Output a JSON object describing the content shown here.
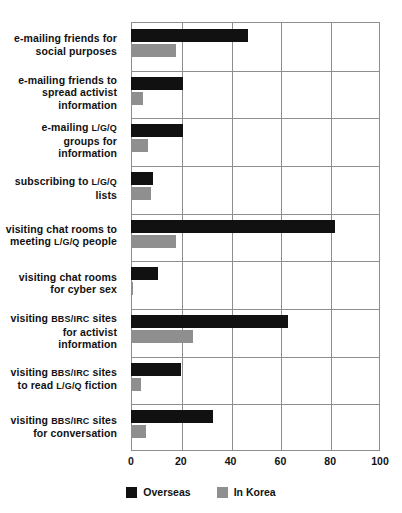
{
  "chart_data": {
    "type": "bar",
    "orientation": "horizontal",
    "title": "",
    "xlabel": "",
    "ylabel": "",
    "xlim": [
      0,
      100
    ],
    "xticks": [
      0,
      20,
      40,
      60,
      80,
      100
    ],
    "grid": true,
    "legend_position": "bottom-center",
    "categories": [
      "e-mailing friends for social purposes",
      "e-mailing friends to spread activist information",
      "e-mailing L/G/Q groups for information",
      "subscribing to L/G/Q lists",
      "visiting chat rooms to meeting L/G/Q people",
      "visiting chat rooms for cyber sex",
      "visiting BBS/IRC sites for activist information",
      "visiting BBS/IRC sites to read L/G/Q fiction",
      "visiting BBS/IRC sites for conversation"
    ],
    "category_lines": [
      [
        "e-mailing friends for",
        "social purposes"
      ],
      [
        "e-mailing friends to",
        "spread activist",
        "information"
      ],
      [
        "e-mailing L/G/Q",
        "groups for",
        "information"
      ],
      [
        "subscribing to L/G/Q",
        "lists"
      ],
      [
        "visiting chat rooms to",
        "meeting L/G/Q people"
      ],
      [
        "visiting chat rooms",
        "for cyber sex"
      ],
      [
        "visiting BBS/IRC sites",
        "for activist",
        "information"
      ],
      [
        "visiting BBS/IRC sites",
        "to read L/G/Q fiction"
      ],
      [
        "visiting BBS/IRC sites",
        "for conversation"
      ]
    ],
    "series": [
      {
        "name": "Overseas",
        "color": "#111111",
        "values": [
          47,
          21,
          21,
          9,
          82,
          11,
          63,
          20,
          33
        ]
      },
      {
        "name": "In Korea",
        "color": "#8f8f8f",
        "values": [
          18,
          5,
          7,
          8,
          18,
          1,
          25,
          4,
          6
        ]
      }
    ]
  },
  "legend": {
    "items": [
      {
        "label": "Overseas",
        "swatch": "overseas"
      },
      {
        "label": "In Korea",
        "swatch": "inkorea"
      }
    ]
  }
}
